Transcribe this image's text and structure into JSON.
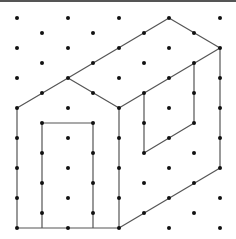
{
  "figure": {
    "colors": {
      "line": "#555555",
      "dot": "#111111",
      "background": "#ffffff",
      "top_rule": "#555555"
    },
    "grid": {
      "row_y": [
        18,
        33,
        48,
        63,
        78,
        93,
        108,
        123,
        138,
        153,
        168,
        183,
        198,
        213,
        228
      ],
      "even_row_x": [
        17,
        68,
        119,
        169,
        220
      ],
      "odd_row_x": [
        42,
        93,
        144,
        194
      ],
      "dot_radius": 2
    },
    "shapes": [
      {
        "name": "front-gable-wall",
        "points": [
          [
            17,
            228
          ],
          [
            17,
            108
          ],
          [
            68,
            78
          ],
          [
            119,
            108
          ],
          [
            119,
            228
          ]
        ],
        "closed": true
      },
      {
        "name": "door",
        "points": [
          [
            42,
            228
          ],
          [
            42,
            123
          ],
          [
            93,
            123
          ],
          [
            93,
            228
          ]
        ],
        "closed": false
      },
      {
        "name": "roof-ridge",
        "points": [
          [
            68,
            78
          ],
          [
            169,
            18
          ]
        ],
        "closed": false
      },
      {
        "name": "back-roof-edge",
        "points": [
          [
            169,
            18
          ],
          [
            220,
            48
          ]
        ],
        "closed": false
      },
      {
        "name": "eave-line",
        "points": [
          [
            220,
            48
          ],
          [
            119,
            108
          ]
        ],
        "closed": false
      },
      {
        "name": "side-wall-right-edge",
        "points": [
          [
            220,
            48
          ],
          [
            220,
            168
          ]
        ],
        "closed": false
      },
      {
        "name": "side-wall-bottom-edge",
        "points": [
          [
            220,
            168
          ],
          [
            119,
            228
          ]
        ],
        "closed": false
      },
      {
        "name": "window",
        "points": [
          [
            144,
            93
          ],
          [
            144,
            153
          ],
          [
            194,
            123
          ],
          [
            194,
            63
          ]
        ],
        "closed": false
      }
    ]
  }
}
